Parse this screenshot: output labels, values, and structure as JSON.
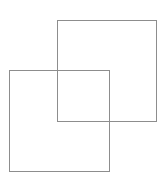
{
  "canvas": {
    "width": 166,
    "height": 180,
    "background_color": "#ffffff",
    "title": "Two overlapping squares"
  },
  "figure": {
    "stroke_color": "#8d8d8d",
    "stroke_width": 1,
    "fill": "none",
    "shape_count": 2
  },
  "shapes": [
    {
      "name": "upper-right-square",
      "label": "Square A",
      "x": 57,
      "y": 20,
      "width": 100,
      "height": 102,
      "stroke_color": "#8d8d8d",
      "stroke_width": 1,
      "fill": "none",
      "corners": {
        "top_left": "57,20",
        "top_right": "157,20",
        "bottom_right": "157,122",
        "bottom_left": "57,122"
      }
    },
    {
      "name": "lower-left-square",
      "label": "Square B",
      "x": 9,
      "y": 70,
      "width": 101,
      "height": 102,
      "stroke_color": "#8d8d8d",
      "stroke_width": 1,
      "fill": "none",
      "corners": {
        "top_left": "9,70",
        "top_right": "110,70",
        "bottom_right": "110,172",
        "bottom_left": "9,172"
      }
    }
  ],
  "overlap_region": {
    "name": "intersection",
    "label": "Overlap",
    "x": 57,
    "y": 70,
    "width": 53,
    "height": 52
  }
}
